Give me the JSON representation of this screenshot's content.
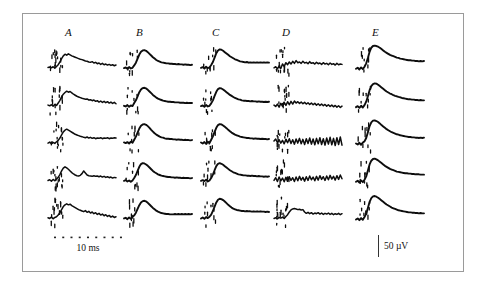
{
  "figure": {
    "background_color": "#ffffff",
    "border_color": "#9a9a9a",
    "trace_color": "#0d0d0d"
  },
  "columns": [
    {
      "label": "A",
      "x": 65
    },
    {
      "label": "B",
      "x": 136
    },
    {
      "label": "C",
      "x": 212
    },
    {
      "label": "D",
      "x": 282
    },
    {
      "label": "E",
      "x": 372
    }
  ],
  "scalebars": {
    "time": {
      "label": "10 ms",
      "dots": 9
    },
    "voltage": {
      "label": "50 µV"
    }
  },
  "chart_data": {
    "type": "line",
    "title": "",
    "subtitle": "",
    "xlabel": "10 ms",
    "ylabel": "50 µV",
    "grid": false,
    "legend_position": "none",
    "layout": {
      "rows": 5,
      "cols": 5,
      "col_labels": [
        "A",
        "B",
        "C",
        "D",
        "E"
      ]
    },
    "x": [
      0,
      1,
      2,
      3,
      4,
      5,
      6,
      7,
      8,
      9,
      10,
      11,
      12,
      13,
      14,
      15,
      16,
      17,
      18,
      19,
      20,
      21,
      22,
      23,
      24,
      25,
      26,
      27,
      28,
      29,
      30,
      31,
      32,
      33,
      34,
      35,
      36,
      37,
      38,
      39,
      40
    ],
    "xlim": [
      0,
      40
    ],
    "ylim": [
      -40,
      60
    ],
    "series": [
      {
        "name": "A1",
        "col": "A",
        "row": 1,
        "values": [
          -6,
          -5,
          -7,
          -4,
          -8,
          -3,
          2,
          10,
          20,
          28,
          33,
          30,
          34,
          31,
          28,
          26,
          24,
          22,
          20,
          18,
          17,
          15,
          13,
          12,
          10,
          9,
          11,
          7,
          9,
          5,
          7,
          3,
          6,
          2,
          4,
          1,
          3,
          0,
          2,
          -1,
          1
        ]
      },
      {
        "name": "A2",
        "col": "A",
        "row": 2,
        "values": [
          -5,
          -7,
          -4,
          -8,
          -3,
          -6,
          1,
          9,
          19,
          27,
          32,
          36,
          33,
          35,
          31,
          27,
          24,
          21,
          19,
          17,
          15,
          14,
          12,
          13,
          10,
          11,
          8,
          10,
          6,
          8,
          4,
          7,
          3,
          6,
          2,
          5,
          1,
          4,
          0,
          3,
          -1
        ]
      },
      {
        "name": "A3",
        "col": "A",
        "row": 3,
        "values": [
          -8,
          -5,
          -10,
          -6,
          -9,
          -4,
          0,
          7,
          16,
          25,
          30,
          33,
          30,
          27,
          24,
          21,
          18,
          16,
          14,
          12,
          11,
          9,
          8,
          10,
          7,
          9,
          6,
          8,
          5,
          7,
          6,
          8,
          5,
          7,
          6,
          8,
          5,
          7,
          6,
          8,
          7
        ]
      },
      {
        "name": "A4",
        "col": "A",
        "row": 4,
        "values": [
          -6,
          -4,
          -8,
          -3,
          -7,
          -2,
          3,
          11,
          22,
          30,
          34,
          31,
          27,
          22,
          17,
          13,
          10,
          8,
          7,
          9,
          14,
          22,
          16,
          10,
          8,
          7,
          6,
          8,
          6,
          7,
          5,
          7,
          4,
          6,
          3,
          5,
          2,
          4,
          1,
          3,
          2
        ]
      },
      {
        "name": "A5",
        "col": "A",
        "row": 5,
        "values": [
          -7,
          -9,
          -5,
          -10,
          -6,
          -4,
          1,
          8,
          17,
          26,
          31,
          34,
          31,
          33,
          29,
          26,
          23,
          20,
          17,
          15,
          13,
          11,
          14,
          9,
          12,
          7,
          10,
          5,
          8,
          3,
          6,
          1,
          4,
          -1,
          2,
          -3,
          0,
          -5,
          -2,
          -6,
          -4
        ]
      },
      {
        "name": "B1",
        "col": "B",
        "row": 1,
        "values": [
          -8,
          -6,
          -10,
          -5,
          -9,
          -7,
          0,
          8,
          20,
          32,
          40,
          44,
          45,
          43,
          39,
          34,
          29,
          24,
          20,
          16,
          13,
          11,
          9,
          8,
          7,
          6,
          6,
          5,
          5,
          4,
          4,
          3,
          4,
          3,
          3,
          2,
          3,
          2,
          2,
          1,
          2
        ]
      },
      {
        "name": "B2",
        "col": "B",
        "row": 2,
        "values": [
          -7,
          -9,
          -5,
          -10,
          -6,
          -8,
          1,
          9,
          21,
          33,
          41,
          45,
          46,
          44,
          40,
          35,
          30,
          25,
          21,
          17,
          14,
          12,
          10,
          8,
          7,
          6,
          5,
          5,
          4,
          4,
          3,
          3,
          3,
          2,
          2,
          2,
          1,
          2,
          1,
          1,
          1
        ]
      },
      {
        "name": "B3",
        "col": "B",
        "row": 3,
        "values": [
          -6,
          -8,
          -5,
          -9,
          -4,
          -7,
          2,
          11,
          23,
          35,
          43,
          47,
          48,
          46,
          42,
          37,
          31,
          26,
          21,
          17,
          14,
          11,
          9,
          8,
          6,
          5,
          5,
          4,
          4,
          3,
          3,
          2,
          3,
          2,
          2,
          1,
          2,
          1,
          1,
          0,
          1
        ]
      },
      {
        "name": "B4",
        "col": "B",
        "row": 4,
        "values": [
          -7,
          -5,
          -9,
          -6,
          -10,
          -6,
          1,
          10,
          22,
          34,
          42,
          45,
          44,
          41,
          37,
          32,
          27,
          22,
          18,
          15,
          12,
          10,
          8,
          7,
          6,
          5,
          4,
          4,
          3,
          3,
          2,
          3,
          2,
          2,
          1,
          2,
          1,
          1,
          1,
          0,
          1
        ]
      },
      {
        "name": "B5",
        "col": "B",
        "row": 5,
        "values": [
          -9,
          -7,
          -11,
          -6,
          -10,
          -5,
          0,
          8,
          19,
          30,
          38,
          42,
          43,
          41,
          37,
          32,
          27,
          22,
          18,
          14,
          11,
          9,
          7,
          6,
          5,
          4,
          4,
          3,
          3,
          3,
          4,
          3,
          4,
          3,
          4,
          3,
          4,
          3,
          4,
          3,
          4
        ]
      },
      {
        "name": "C1",
        "col": "C",
        "row": 1,
        "values": [
          -7,
          -5,
          -9,
          -4,
          -8,
          -6,
          1,
          10,
          23,
          36,
          44,
          47,
          46,
          43,
          39,
          35,
          31,
          27,
          24,
          21,
          18,
          16,
          14,
          12,
          11,
          10,
          9,
          10,
          8,
          9,
          8,
          9,
          8,
          9,
          8,
          9,
          8,
          9,
          8,
          9,
          8
        ]
      },
      {
        "name": "C2",
        "col": "C",
        "row": 2,
        "values": [
          -8,
          -6,
          -10,
          -5,
          -9,
          -7,
          0,
          9,
          22,
          34,
          42,
          45,
          44,
          41,
          37,
          33,
          29,
          25,
          22,
          19,
          16,
          14,
          12,
          11,
          9,
          8,
          8,
          7,
          7,
          6,
          7,
          6,
          6,
          5,
          6,
          5,
          5,
          4,
          5,
          4,
          5
        ]
      },
      {
        "name": "C3",
        "col": "C",
        "row": 3,
        "values": [
          -6,
          -9,
          -5,
          -10,
          -4,
          -8,
          2,
          12,
          25,
          37,
          45,
          48,
          47,
          44,
          40,
          36,
          31,
          27,
          23,
          20,
          17,
          15,
          13,
          11,
          10,
          9,
          8,
          7,
          7,
          6,
          6,
          5,
          6,
          5,
          5,
          4,
          5,
          4,
          4,
          3,
          4
        ]
      },
      {
        "name": "C4",
        "col": "C",
        "row": 4,
        "values": [
          -7,
          -5,
          -8,
          -4,
          -9,
          -6,
          1,
          11,
          24,
          36,
          43,
          45,
          43,
          40,
          36,
          32,
          28,
          24,
          21,
          18,
          16,
          14,
          12,
          11,
          10,
          9,
          9,
          8,
          8,
          7,
          8,
          7,
          7,
          6,
          7,
          6,
          6,
          5,
          6,
          5,
          6
        ]
      },
      {
        "name": "C5",
        "col": "C",
        "row": 5,
        "values": [
          -9,
          -6,
          -10,
          -5,
          -8,
          -4,
          2,
          13,
          26,
          38,
          46,
          49,
          48,
          45,
          41,
          36,
          31,
          27,
          23,
          20,
          18,
          16,
          15,
          14,
          13,
          13,
          12,
          13,
          12,
          12,
          11,
          12,
          11,
          12,
          11,
          12,
          11,
          11,
          10,
          11,
          10
        ]
      },
      {
        "name": "D1",
        "col": "D",
        "row": 1,
        "values": [
          -7,
          -4,
          -10,
          -2,
          -9,
          4,
          -3,
          8,
          2,
          10,
          4,
          12,
          6,
          14,
          8,
          10,
          6,
          12,
          7,
          9,
          5,
          11,
          6,
          8,
          4,
          9,
          5,
          7,
          3,
          8,
          4,
          6,
          2,
          7,
          3,
          5,
          1,
          6,
          2,
          4,
          3
        ]
      },
      {
        "name": "D2",
        "col": "D",
        "row": 2,
        "values": [
          -5,
          -9,
          -2,
          -11,
          0,
          -8,
          3,
          -6,
          5,
          -4,
          6,
          -2,
          7,
          1,
          5,
          0,
          4,
          -1,
          3,
          -2,
          2,
          -3,
          1,
          -4,
          0,
          -5,
          -1,
          -6,
          -2,
          -7,
          -3,
          -8,
          -4,
          -9,
          -5,
          -10,
          -6,
          -11,
          -7,
          -12,
          -8
        ]
      },
      {
        "name": "D3",
        "col": "D",
        "row": 3,
        "values": [
          -2,
          4,
          -6,
          2,
          -8,
          0,
          -10,
          3,
          -7,
          5,
          -9,
          2,
          -11,
          4,
          -8,
          6,
          -10,
          3,
          -12,
          5,
          -9,
          7,
          -11,
          4,
          -13,
          6,
          -10,
          8,
          -12,
          5,
          -14,
          7,
          -11,
          9,
          -13,
          6,
          -15,
          8,
          -12,
          10,
          -14
        ]
      },
      {
        "name": "D4",
        "col": "D",
        "row": 4,
        "values": [
          -6,
          2,
          -9,
          4,
          -7,
          1,
          -10,
          3,
          -8,
          5,
          -6,
          2,
          -9,
          4,
          -7,
          6,
          -5,
          3,
          -8,
          5,
          -6,
          7,
          -4,
          4,
          -7,
          6,
          -5,
          8,
          -3,
          5,
          -6,
          7,
          -4,
          9,
          -2,
          6,
          -5,
          8,
          -3,
          10,
          -1
        ]
      },
      {
        "name": "D5",
        "col": "D",
        "row": 5,
        "values": [
          -9,
          -7,
          -10,
          -6,
          -8,
          -5,
          -9,
          -3,
          2,
          10,
          16,
          19,
          20,
          19,
          17,
          18,
          16,
          17,
          10,
          6,
          9,
          5,
          8,
          4,
          7,
          5,
          8,
          4,
          7,
          3,
          6,
          4,
          7,
          3,
          6,
          2,
          5,
          3,
          6,
          2,
          5
        ]
      },
      {
        "name": "E1",
        "col": "E",
        "row": 1,
        "values": [
          -10,
          -7,
          -12,
          -6,
          -11,
          -4,
          6,
          22,
          40,
          52,
          57,
          58,
          57,
          55,
          52,
          48,
          44,
          40,
          37,
          34,
          31,
          29,
          27,
          25,
          23,
          22,
          20,
          19,
          18,
          17,
          16,
          15,
          15,
          14,
          14,
          13,
          13,
          12,
          13,
          12,
          13
        ]
      },
      {
        "name": "E2",
        "col": "E",
        "row": 2,
        "values": [
          -11,
          -8,
          -13,
          -7,
          -12,
          -5,
          5,
          21,
          39,
          51,
          57,
          59,
          58,
          55,
          51,
          47,
          43,
          39,
          35,
          32,
          29,
          27,
          24,
          22,
          21,
          19,
          18,
          16,
          15,
          14,
          13,
          12,
          12,
          11,
          11,
          10,
          10,
          9,
          10,
          9,
          9
        ]
      },
      {
        "name": "E3",
        "col": "E",
        "row": 3,
        "values": [
          -9,
          -12,
          -7,
          -13,
          -6,
          -3,
          7,
          24,
          42,
          53,
          58,
          59,
          57,
          54,
          50,
          45,
          41,
          37,
          33,
          30,
          27,
          24,
          22,
          20,
          18,
          17,
          15,
          14,
          13,
          12,
          11,
          10,
          10,
          9,
          9,
          8,
          8,
          7,
          8,
          7,
          8
        ]
      },
      {
        "name": "E4",
        "col": "E",
        "row": 4,
        "values": [
          -10,
          -7,
          -12,
          -6,
          -11,
          -4,
          6,
          23,
          41,
          52,
          57,
          58,
          56,
          53,
          49,
          45,
          41,
          37,
          34,
          31,
          28,
          26,
          24,
          22,
          20,
          19,
          18,
          17,
          16,
          15,
          15,
          14,
          14,
          13,
          13,
          12,
          12,
          12,
          11,
          11,
          11
        ]
      },
      {
        "name": "E5",
        "col": "E",
        "row": 5,
        "values": [
          -12,
          -9,
          -14,
          -8,
          -13,
          -5,
          5,
          22,
          40,
          51,
          56,
          57,
          55,
          52,
          48,
          44,
          40,
          36,
          32,
          29,
          26,
          23,
          21,
          19,
          17,
          15,
          14,
          13,
          12,
          11,
          10,
          9,
          9,
          8,
          8,
          7,
          7,
          6,
          7,
          6,
          6
        ]
      }
    ]
  }
}
